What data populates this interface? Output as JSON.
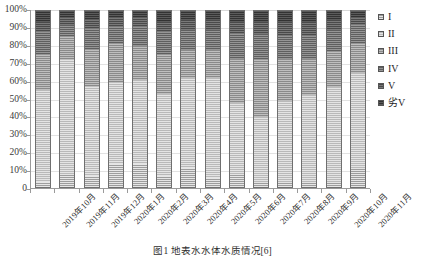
{
  "chart_data": {
    "type": "bar",
    "stacked": true,
    "normalized": "100%",
    "title": "",
    "xlabel": "",
    "ylabel": "",
    "ylim": [
      0,
      100
    ],
    "grid": true,
    "legend_position": "right",
    "categories": [
      "2019年10月",
      "2019年11月",
      "2019年12月",
      "2020年1月",
      "2020年2月",
      "2020年3月",
      "2020年4月",
      "2020年5月",
      "2020年6月",
      "2020年7月",
      "2020年8月",
      "2020年9月",
      "2020年10月",
      "2020年11月"
    ],
    "y_tick_labels": [
      "100%",
      "90%",
      "80%",
      "70%",
      "60%",
      "50%",
      "40%",
      "30%",
      "20%",
      "10%",
      "0"
    ],
    "y_tick_values": [
      100,
      90,
      80,
      70,
      60,
      50,
      40,
      30,
      20,
      10,
      0
    ],
    "series": [
      {
        "name": "I",
        "values": [
          3,
          7,
          6,
          13,
          13,
          6,
          11,
          5,
          7,
          2,
          2,
          2,
          2,
          10
        ]
      },
      {
        "name": "II",
        "values": [
          52,
          65,
          51,
          46,
          48,
          47,
          51,
          57,
          41,
          38,
          47,
          50,
          55,
          55
        ]
      },
      {
        "name": "III",
        "values": [
          20,
          13,
          21,
          22,
          19,
          22,
          16,
          16,
          25,
          32,
          24,
          21,
          20,
          16
        ]
      },
      {
        "name": "IV",
        "values": [
          13,
          7,
          12,
          10,
          11,
          13,
          11,
          11,
          14,
          15,
          13,
          13,
          12,
          11
        ]
      },
      {
        "name": "V",
        "values": [
          6,
          4,
          5,
          5,
          5,
          6,
          6,
          6,
          7,
          7,
          8,
          8,
          6,
          4
        ]
      },
      {
        "name": "劣V",
        "values": [
          6,
          4,
          5,
          4,
          4,
          6,
          5,
          5,
          6,
          6,
          6,
          6,
          5,
          4
        ]
      }
    ]
  },
  "legend": {
    "items": [
      {
        "label": "I"
      },
      {
        "label": "II"
      },
      {
        "label": "III"
      },
      {
        "label": "IV"
      },
      {
        "label": "V"
      },
      {
        "label": "劣V"
      }
    ]
  },
  "caption": {
    "text": "图1  地表水水体水质情况[6]"
  }
}
